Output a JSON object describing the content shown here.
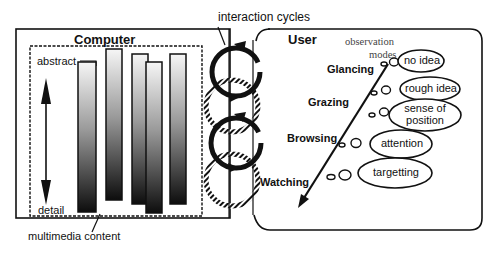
{
  "title_labels": {
    "interaction_cycles": "interaction cycles",
    "computer": "Computer",
    "user": "User",
    "multimedia_content": "multimedia content",
    "abstract": "abstract",
    "detail": "detail",
    "observation_modes": "observation\nmodes"
  },
  "observation_modes": [
    {
      "mode": "Glancing",
      "result": "no idea"
    },
    {
      "mode": "Grazing",
      "result": "rough idea"
    },
    {
      "mode": "Browsing",
      "result": "attention"
    },
    {
      "mode": "Watching",
      "result": "targetting"
    }
  ],
  "position_bubble": "sense of\nposition",
  "observation_label_line1": "observation",
  "observation_label_line2": "modes",
  "bubbles": {
    "no_idea": "no idea",
    "rough_idea": "rough idea",
    "sense_of": "sense of",
    "position": "position",
    "attention": "attention",
    "targetting": "targetting"
  },
  "modes": {
    "glancing": "Glancing",
    "grazing": "Grazing",
    "browsing": "Browsing",
    "watching": "Watching"
  },
  "content_bars": [
    {
      "x": 78,
      "top": 62,
      "bottom": 212
    },
    {
      "x": 106,
      "top": 49,
      "bottom": 200
    },
    {
      "x": 132,
      "top": 54,
      "bottom": 204
    },
    {
      "x": 146,
      "top": 62,
      "bottom": 213
    },
    {
      "x": 170,
      "top": 54,
      "bottom": 204
    }
  ],
  "colors": {
    "stroke": "#111111",
    "bar_top": "#f4f4f4",
    "bar_bottom": "#111111",
    "background": "#ffffff"
  }
}
